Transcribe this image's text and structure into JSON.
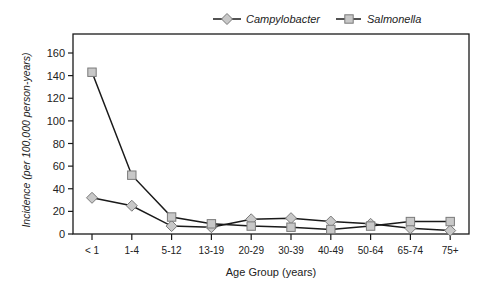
{
  "chart_data": {
    "type": "line",
    "title": "",
    "xlabel": "Age Group (years)",
    "ylabel": "Incidence (per 100,000 person-years)",
    "categories": [
      "< 1",
      "1-4",
      "5-12",
      "13-19",
      "20-29",
      "30-39",
      "40-49",
      "50-64",
      "65-74",
      "75+"
    ],
    "series": [
      {
        "name": "Campylobacter",
        "marker": "diamond",
        "values": [
          32,
          25,
          7,
          6,
          13,
          14,
          11,
          9,
          5,
          3
        ]
      },
      {
        "name": "Salmonella",
        "marker": "square",
        "values": [
          143,
          52,
          15,
          9,
          7,
          6,
          4,
          7,
          11,
          11
        ]
      }
    ],
    "ylim": [
      0,
      160
    ],
    "yticks": [
      0,
      20,
      40,
      60,
      80,
      100,
      120,
      140,
      160
    ],
    "grid": false,
    "legend_position": "top"
  },
  "legend": {
    "items": [
      {
        "label": "Campylobacter",
        "marker": "diamond-icon"
      },
      {
        "label": "Salmonella",
        "marker": "square-icon"
      }
    ]
  },
  "colors": {
    "line": "#1a1a1a",
    "marker_fill": "#c8c8c8",
    "marker_stroke": "#7a7a7a",
    "axis": "#1a1a1a"
  }
}
